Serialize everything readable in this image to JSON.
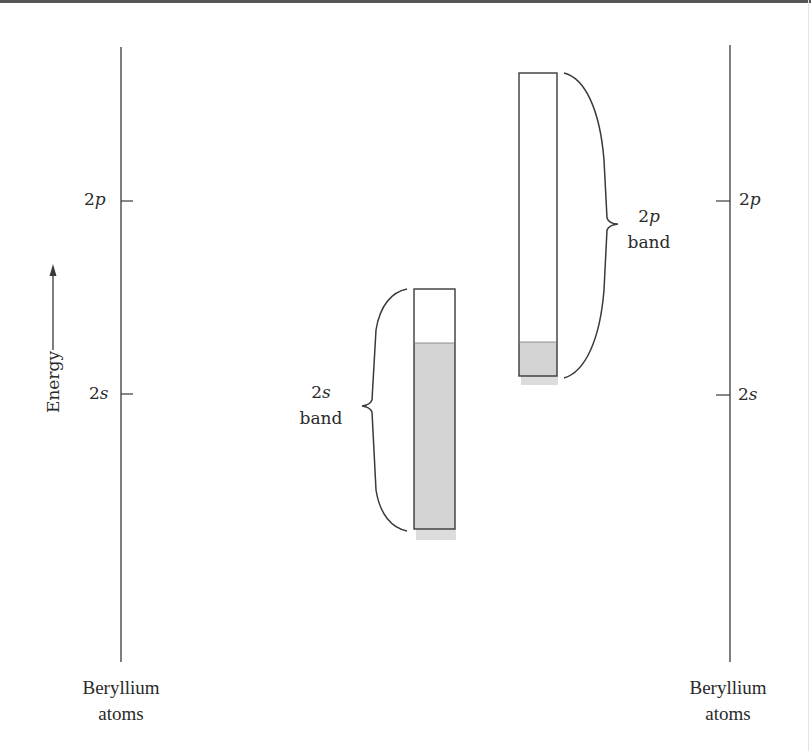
{
  "diagram": {
    "title": "",
    "axis": {
      "energy_label": "Energy",
      "arrow_direction": "up"
    },
    "left_column": {
      "levels": [
        {
          "label_num": "2",
          "label_orb": "p",
          "y": 200
        },
        {
          "label_num": "2",
          "label_orb": "s",
          "y": 394
        }
      ],
      "caption_line1": "Beryllium",
      "caption_line2": "atoms"
    },
    "right_column": {
      "levels": [
        {
          "label_num": "2",
          "label_orb": "p",
          "y": 200
        },
        {
          "label_num": "2",
          "label_orb": "s",
          "y": 394
        }
      ],
      "caption_line1": "Beryllium",
      "caption_line2": "atoms"
    },
    "bands": [
      {
        "name": "2s band",
        "label_num": "2",
        "label_orb": "s",
        "label_word": "band",
        "top": 289,
        "bottom": 529,
        "filled_from": 343,
        "fill_color": "#d4d4d4"
      },
      {
        "name": "2p band",
        "label_num": "2",
        "label_orb": "p",
        "label_word": "band",
        "top": 73,
        "bottom": 376,
        "filled_from": 342,
        "fill_color": "#d4d4d4"
      }
    ],
    "colors": {
      "line": "#3a3a3a",
      "band_fill": "#d4d4d4",
      "shadow": "#dcdcdc"
    }
  }
}
